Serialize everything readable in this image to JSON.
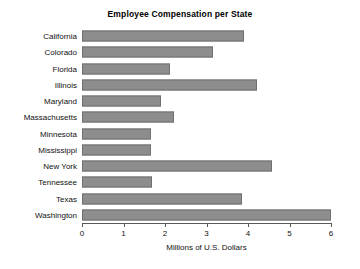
{
  "chart_data": {
    "type": "bar",
    "orientation": "horizontal",
    "title": "Employee Compensation per State",
    "xlabel": "Millions of U.S. Dollars",
    "ylabel": "",
    "xlim": [
      0,
      6
    ],
    "xticks": [
      0,
      1,
      2,
      3,
      4,
      5,
      6
    ],
    "xtick_labels": [
      "0",
      "1",
      "2",
      "3",
      "4",
      "5",
      "6"
    ],
    "grid": false,
    "legend": "none",
    "bar_color": "#8d8d8d",
    "bar_edge_color": "#6f6f6f",
    "categories": [
      "California",
      "Colorado",
      "Florida",
      "Illinois",
      "Maryland",
      "Massachusetts",
      "Minnesota",
      "Mississippi",
      "New York",
      "Tennessee",
      "Texas",
      "Washington"
    ],
    "values": [
      3.9,
      3.16,
      2.12,
      4.22,
      1.9,
      2.22,
      1.66,
      1.66,
      4.58,
      1.69,
      3.86,
      6.0
    ]
  }
}
